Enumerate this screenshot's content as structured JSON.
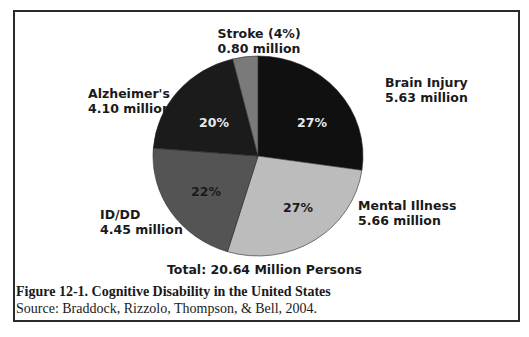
{
  "chart_data": {
    "type": "pie",
    "title": "Figure 12-1.  Cognitive Disability in the United States",
    "source": "Source: Braddock, Rizzolo, Thompson, & Bell, 2004.",
    "total_label": "Total: 20.64 Million Persons",
    "start_angle_deg": 0,
    "direction": "clockwise",
    "slices": [
      {
        "name": "Brain Injury",
        "value_label": "5.63 million",
        "value": 5.63,
        "percent": 27,
        "percent_label": "27%",
        "color": "#101010",
        "pct_text_color": "#e8e8e8"
      },
      {
        "name": "Mental Illness",
        "value_label": "5.66 million",
        "value": 5.66,
        "percent": 27,
        "percent_label": "27%",
        "color": "#bcbcbc",
        "pct_text_color": "#1a1a1a"
      },
      {
        "name": "ID/DD",
        "value_label": "4.45 million",
        "value": 4.45,
        "percent": 22,
        "percent_label": "22%",
        "color": "#545454",
        "pct_text_color": "#1a1a1a"
      },
      {
        "name": "Alzheimer's",
        "value_label": "4.10 million",
        "value": 4.1,
        "percent": 20,
        "percent_label": "20%",
        "color": "#1b1b1b",
        "pct_text_color": "#e8e8e8"
      },
      {
        "name": "Stroke (4%)",
        "value_label": "0.80 million",
        "value": 0.8,
        "percent": 4,
        "percent_label": "",
        "color": "#7a7a7a",
        "pct_text_color": "#1a1a1a"
      }
    ]
  },
  "labels": {
    "stroke": {
      "name": "Stroke (4%)",
      "value": "0.80 million"
    },
    "brain_injury": {
      "name": "Brain Injury",
      "value": "5.63 million",
      "pct": "27%"
    },
    "mental_illness": {
      "name": "Mental Illness",
      "value": "5.66 million",
      "pct": "27%"
    },
    "id_dd": {
      "name": "ID/DD",
      "value": "4.45 million",
      "pct": "22%"
    },
    "alzheimers": {
      "name": "Alzheimer's",
      "value": "4.10 million",
      "pct": "20%"
    }
  },
  "total": "Total: 20.64 Million Persons",
  "caption": {
    "figure": "Figure 12-1.  Cognitive Disability in the United States",
    "source": "Source: Braddock, Rizzolo, Thompson, & Bell, 2004."
  }
}
